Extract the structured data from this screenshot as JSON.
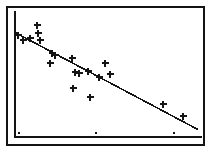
{
  "figure": {
    "title": "",
    "background_color": "#ffffff",
    "ink_color": "#141414",
    "frame": {
      "x": 7,
      "y": 7,
      "width": 197,
      "height": 138,
      "stroke_width": 2
    },
    "axis": {
      "vertical_line_x": 15,
      "vertical_line_y_top": 12,
      "vertical_line_y_bottom": 137,
      "horizontal_line_y": 137,
      "horizontal_line_x_start": 15,
      "horizontal_line_x_end": 201,
      "stroke_width": 2
    }
  },
  "chart_data": {
    "type": "scatter",
    "title": "",
    "subtitle": "",
    "xlabel": "",
    "ylabel": "",
    "xlim": [
      0,
      211
    ],
    "ylim": [
      0,
      152
    ],
    "grid": false,
    "legend": null,
    "marker_style": "plus",
    "marker_size": 7,
    "marker_stroke_width": 2.2,
    "correlation": "negative",
    "series": [
      {
        "name": "observations",
        "marker": "plus",
        "color": "#141414",
        "points": [
          {
            "x": 18,
            "y": 35
          },
          {
            "x": 23,
            "y": 40
          },
          {
            "x": 37,
            "y": 25
          },
          {
            "x": 38,
            "y": 33
          },
          {
            "x": 30,
            "y": 38
          },
          {
            "x": 40,
            "y": 40
          },
          {
            "x": 52,
            "y": 53
          },
          {
            "x": 55,
            "y": 55
          },
          {
            "x": 50,
            "y": 63
          },
          {
            "x": 72,
            "y": 58
          },
          {
            "x": 75,
            "y": 72
          },
          {
            "x": 79,
            "y": 73
          },
          {
            "x": 88,
            "y": 71
          },
          {
            "x": 73,
            "y": 88
          },
          {
            "x": 90,
            "y": 97
          },
          {
            "x": 105,
            "y": 63
          },
          {
            "x": 99,
            "y": 77
          },
          {
            "x": 110,
            "y": 74
          },
          {
            "x": 163,
            "y": 104
          },
          {
            "x": 183,
            "y": 116
          }
        ]
      }
    ],
    "trend_line": {
      "name": "regression-line",
      "color": "#141414",
      "stroke_width": 1.6,
      "x1": 16,
      "y1": 33,
      "x2": 197,
      "y2": 129
    },
    "x_ticks": [
      {
        "x": 19,
        "y": 133,
        "label": ""
      },
      {
        "x": 96,
        "y": 133,
        "label": ""
      },
      {
        "x": 174,
        "y": 133,
        "label": ""
      }
    ],
    "tick_marker_size": 2
  }
}
